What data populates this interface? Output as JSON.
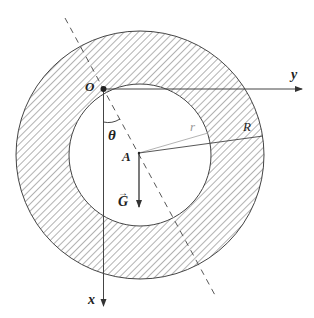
{
  "figure": {
    "labels": {
      "origin": "O",
      "y_axis": "y",
      "x_axis": "x",
      "angle": "θ",
      "center": "A",
      "inner_radius": "r",
      "outer_radius": "R",
      "gravity": "G",
      "gravity_vector_mark": "→"
    },
    "colors": {
      "stroke": "#444444",
      "hatch": "#555555",
      "inner_radius_line": "#aaaaaa",
      "label": "#222222",
      "background": "#ffffff"
    },
    "geometry": {
      "outer_circle": {
        "cx": 140,
        "cy": 155,
        "r": 124
      },
      "inner_circle": {
        "cx": 140,
        "cy": 155,
        "r": 71
      },
      "origin_point": {
        "x": 103,
        "y": 89
      },
      "center_point": {
        "x": 139,
        "y": 153
      }
    }
  }
}
